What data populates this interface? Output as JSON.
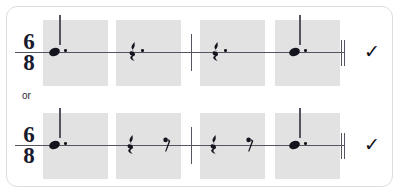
{
  "card": {
    "border_color": "#dedede",
    "background": "#ffffff"
  },
  "colors": {
    "measure_highlight": "#e2e2e2",
    "staff_line": "#55555f",
    "ink": "#14141e"
  },
  "separator": {
    "label": "or"
  },
  "systems": [
    {
      "id": "system-1",
      "time_signature": {
        "numerator": "6",
        "denominator": "8"
      },
      "status_mark": "✓",
      "measures": [
        {
          "index": 1,
          "highlighted": true,
          "symbols": [
            {
              "kind": "note",
              "value": "dotted-quarter-note",
              "dotted": true
            }
          ]
        },
        {
          "index": 2,
          "highlighted": true,
          "symbols": [
            {
              "kind": "rest",
              "value": "dotted-quarter-rest",
              "dotted": true
            }
          ]
        },
        {
          "index": 3,
          "highlighted": true,
          "symbols": [
            {
              "kind": "rest",
              "value": "dotted-quarter-rest",
              "dotted": true
            }
          ]
        },
        {
          "index": 4,
          "highlighted": true,
          "symbols": [
            {
              "kind": "note",
              "value": "dotted-quarter-note",
              "dotted": true
            }
          ]
        }
      ],
      "barlines": [
        "single-barline-mid",
        "final-double-barline"
      ]
    },
    {
      "id": "system-2",
      "time_signature": {
        "numerator": "6",
        "denominator": "8"
      },
      "status_mark": "✓",
      "measures": [
        {
          "index": 1,
          "highlighted": true,
          "symbols": [
            {
              "kind": "note",
              "value": "dotted-quarter-note",
              "dotted": true
            }
          ]
        },
        {
          "index": 2,
          "highlighted": true,
          "symbols": [
            {
              "kind": "rest",
              "value": "quarter-rest",
              "dotted": false
            },
            {
              "kind": "rest",
              "value": "eighth-rest",
              "dotted": false
            }
          ]
        },
        {
          "index": 3,
          "highlighted": true,
          "symbols": [
            {
              "kind": "rest",
              "value": "quarter-rest",
              "dotted": false
            },
            {
              "kind": "rest",
              "value": "eighth-rest",
              "dotted": false
            }
          ]
        },
        {
          "index": 4,
          "highlighted": true,
          "symbols": [
            {
              "kind": "note",
              "value": "dotted-quarter-note",
              "dotted": true
            }
          ]
        }
      ],
      "barlines": [
        "single-barline-mid",
        "final-double-barline"
      ]
    }
  ]
}
